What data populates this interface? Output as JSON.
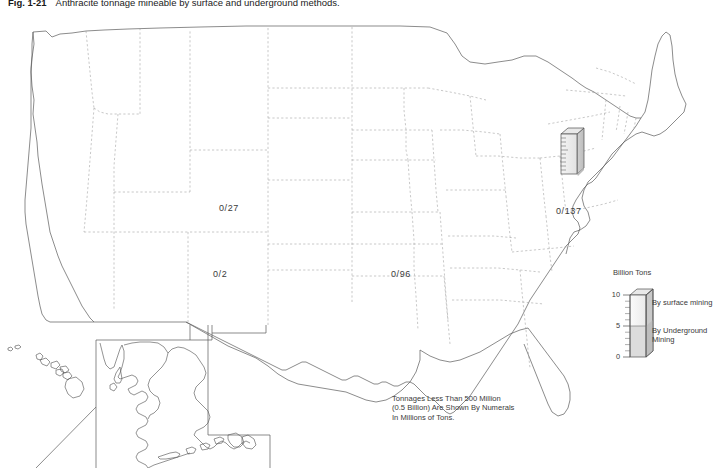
{
  "figure": {
    "number": "Fig. 1-21",
    "caption": "Anthracite tonnage mineable by surface and underground methods.",
    "background_color": "#ffffff",
    "outline_color": "#555555",
    "border_color": "#a8a8a8"
  },
  "map": {
    "name": "united-states-map",
    "includes_insets": [
      "Alaska",
      "Hawaii"
    ],
    "value_labels": [
      {
        "text": "0/27",
        "x": 219,
        "y": 208,
        "state": "Colorado"
      },
      {
        "text": "0/2",
        "x": 213,
        "y": 274,
        "state": "New Mexico"
      },
      {
        "text": "0/96",
        "x": 391,
        "y": 274,
        "state": "Arkansas"
      },
      {
        "text": "0/137",
        "x": 556,
        "y": 211,
        "state": "Virginia"
      }
    ],
    "footnote": [
      "Tonnages Less Than 500 Million",
      "(0.5 Billion) Are Shown By Numerals",
      "In Millions of Tons."
    ],
    "bars": [
      {
        "name": "pennsylvania-tonnage-bar",
        "state": "Pennsylvania",
        "x": 561,
        "y": 128,
        "width": 16,
        "height": 46,
        "depth": 7,
        "surface_fraction": 0.12,
        "underground_fraction": 0.88
      }
    ]
  },
  "legend": {
    "title": "Billion Tons",
    "scale_max": 10,
    "scale_min": 0,
    "tick_labels": [
      {
        "value": "10",
        "position": 10
      },
      {
        "value": "5",
        "position": 5
      },
      {
        "value": "0",
        "position": 0
      }
    ],
    "minor_ticks": [
      1,
      2,
      3,
      4,
      6,
      7,
      8,
      9
    ],
    "surface_label": "By surface mining",
    "underground_label_line1": "By Underground",
    "underground_label_line2": "Mining",
    "surface_fill": "#ffffff",
    "underground_fill": "#dcdcdc",
    "divider_value": 5
  }
}
